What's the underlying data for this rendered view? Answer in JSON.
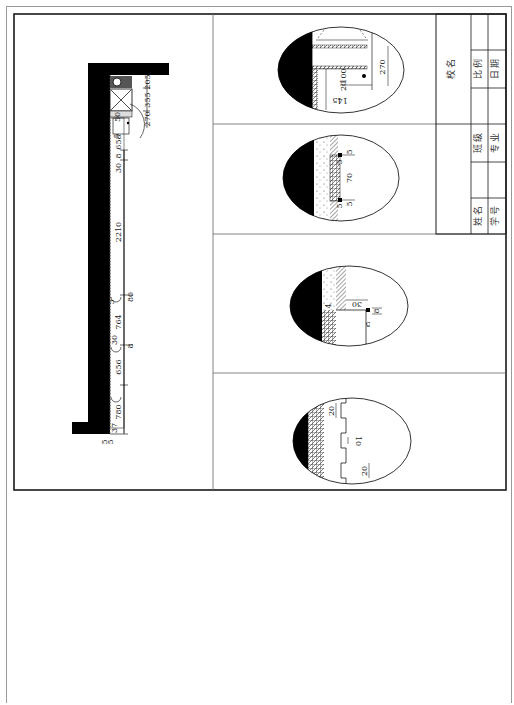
{
  "drawing": {
    "type": "architectural-construction-detail-sheet",
    "orientation": "rotated-90",
    "colors": {
      "background": "#ffffff",
      "line": "#222222",
      "wall_fill": "#000000",
      "frame": "#1a1a1a",
      "sheet_border": "#9a9a9a"
    }
  },
  "plan": {
    "dimensions": [
      "205",
      "355",
      "270",
      "50",
      "5",
      "658",
      "8",
      "30",
      "2210",
      "80",
      "5",
      "764",
      "30",
      "8",
      "656",
      "780",
      "37",
      "5",
      "5"
    ]
  },
  "details": [
    {
      "id": "detail-1",
      "dimensions": [
        "270",
        "20",
        "100",
        "145"
      ]
    },
    {
      "id": "detail-2",
      "dimensions": [
        "5",
        "5",
        "70",
        "5",
        "5"
      ]
    },
    {
      "id": "detail-3",
      "dimensions": [
        "30",
        "8",
        "5",
        "4"
      ]
    },
    {
      "id": "detail-4",
      "dimensions": [
        "20",
        "10",
        "20"
      ]
    }
  ],
  "title_block": {
    "school_name_label": "校 名",
    "scale_label": "比 例",
    "date_label": "日 期",
    "class_label": "班 级",
    "major_label": "专 业",
    "name_label": "姓 名",
    "student_id_label": "学 号"
  }
}
